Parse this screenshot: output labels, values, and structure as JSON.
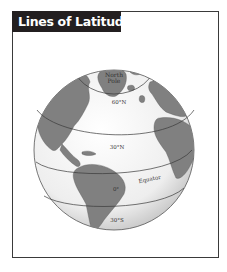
{
  "title": "Lines of Latitude",
  "labels": {
    "north_pole_line1": "North",
    "north_pole_line2": "Pole",
    "lat_60n": "60°N",
    "lat_30n": "30°N",
    "equator": "Equator",
    "lat_0": "0°",
    "lat_30s": "30°S"
  },
  "colors": {
    "title_bg": "#231f20",
    "title_text": "#ffffff",
    "land": "#7d7d7d",
    "ocean": "#f2f2f2",
    "lines": "#3a3a3a"
  }
}
